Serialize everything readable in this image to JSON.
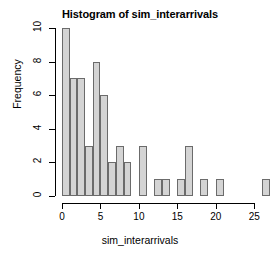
{
  "chart_data": {
    "type": "bar",
    "title": "Histogram of sim_interarrivals",
    "xlabel": "sim_interarrivals",
    "ylabel": "Frequency",
    "xlim": [
      0,
      26
    ],
    "ylim": [
      0,
      10
    ],
    "grid": false,
    "legend": null,
    "bin_width": 1,
    "x_ticks": [
      0,
      5,
      10,
      15,
      20,
      25
    ],
    "y_ticks": [
      0,
      2,
      4,
      6,
      8,
      10
    ],
    "bin_starts": [
      0,
      1,
      2,
      3,
      4,
      5,
      6,
      7,
      8,
      9,
      10,
      11,
      12,
      13,
      14,
      15,
      16,
      17,
      18,
      19,
      20,
      21,
      22,
      23,
      24,
      25,
      26
    ],
    "values": [
      10,
      7,
      7,
      3,
      8,
      6,
      2,
      3,
      2,
      0,
      3,
      0,
      1,
      1,
      0,
      1,
      3,
      0,
      1,
      0,
      1,
      0,
      0,
      0,
      0,
      0,
      1
    ],
    "bar_fill": "#d4d4d4",
    "bar_stroke": "#6b6b6b",
    "axis_color": "#000000",
    "background": "#ffffff"
  }
}
